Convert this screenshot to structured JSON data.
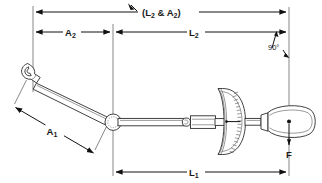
{
  "diagram": {
    "background_color": "#ffffff",
    "line_color": "#111111",
    "dimensions": [
      {
        "id": "L2_and_A2",
        "label": "(L",
        "label_sub": "2",
        "label_mid": " & A",
        "label_sub2": "2",
        "label_end": ")",
        "full_text": "(L2 & A2)",
        "orientation": "horizontal",
        "position": "top"
      },
      {
        "id": "A2",
        "label": "A",
        "label_sub": "2",
        "full_text": "A2",
        "orientation": "horizontal",
        "position": "upper-left"
      },
      {
        "id": "L2",
        "label": "L",
        "label_sub": "2",
        "full_text": "L2",
        "orientation": "horizontal",
        "position": "upper-right"
      },
      {
        "id": "A1",
        "label": "A",
        "label_sub": "1",
        "full_text": "A1",
        "orientation": "diagonal",
        "position": "lower-left"
      },
      {
        "id": "L1",
        "label": "L",
        "label_sub": "1",
        "full_text": "L1",
        "orientation": "horizontal",
        "position": "bottom"
      }
    ],
    "angle_annotation": {
      "id": "right-angle",
      "text": "90",
      "degree_symbol": "°",
      "full_text": "90°"
    },
    "force_annotation": {
      "id": "applied-force",
      "label": "F",
      "direction": "downward"
    },
    "components": [
      {
        "id": "open-end-wrench-head",
        "name": "open-end wrench head"
      },
      {
        "id": "wrench-arm",
        "name": "wrench arm"
      },
      {
        "id": "pivot-joint",
        "name": "pivot joint"
      },
      {
        "id": "extension-bar",
        "name": "extension bar"
      },
      {
        "id": "link-joint",
        "name": "link joint"
      },
      {
        "id": "dial-gauge",
        "name": "dial indicator gauge"
      },
      {
        "id": "handle",
        "name": "handle grip"
      }
    ]
  }
}
